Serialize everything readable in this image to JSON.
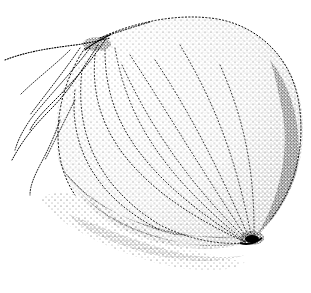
{
  "image": {
    "subject": "stippled onion illustration",
    "style": "black-and-white stipple / pointillism drawing",
    "background_color": "#ffffff",
    "ink_color": "#000000",
    "elements": [
      "onion-bulb",
      "root-tendrils",
      "vertical-vein-lines",
      "basal-plate",
      "shadow-stipple"
    ]
  }
}
